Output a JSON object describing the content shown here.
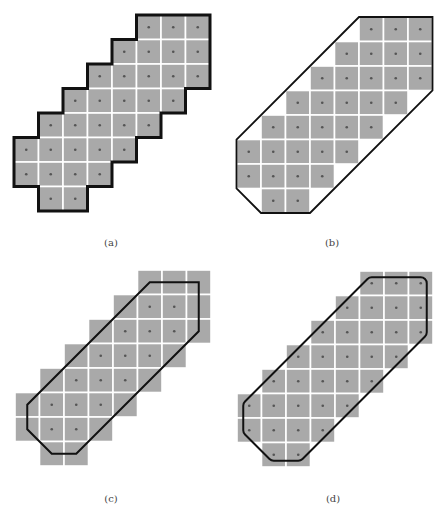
{
  "figure": {
    "cell_size": 24.5,
    "colors": {
      "pixel_fill": "#a9a9a9",
      "grid_line": "#ffffff",
      "dot": "#555555",
      "outline": "#111111"
    },
    "pixel_set": {
      "description": "Digital pixel set (rows top to bottom, column indices)",
      "rows": [
        [
          5,
          6,
          7
        ],
        [
          4,
          5,
          6,
          7
        ],
        [
          3,
          4,
          5,
          6,
          7
        ],
        [
          2,
          3,
          4,
          5,
          6
        ],
        [
          1,
          2,
          3,
          4,
          5
        ],
        [
          0,
          1,
          2,
          3,
          4
        ],
        [
          0,
          1,
          2,
          3
        ],
        [
          1,
          2
        ]
      ]
    },
    "panels": [
      {
        "id": "a",
        "caption": "(a)",
        "origin": [
          14,
          15
        ],
        "caption_pos": [
          111,
          242
        ],
        "outline_type": "pixel-boundary",
        "dots": "all"
      },
      {
        "id": "b",
        "caption": "(b)",
        "origin": [
          236.5,
          17
        ],
        "caption_pos": [
          332,
          242
        ],
        "outline_type": "hull-of-squares",
        "hull_vertices_grid": [
          [
            5,
            0
          ],
          [
            8,
            0
          ],
          [
            8,
            3
          ],
          [
            3,
            8
          ],
          [
            1,
            8
          ],
          [
            0,
            7
          ],
          [
            0,
            5
          ]
        ],
        "dots": "all"
      },
      {
        "id": "c",
        "caption": "(c)",
        "origin": [
          15,
          270
        ],
        "caption_pos": [
          111,
          498
        ],
        "outline_type": "hull-of-centers",
        "hull_vertices_grid": [
          [
            5,
            0
          ],
          [
            7,
            0
          ],
          [
            7,
            2
          ],
          [
            2,
            7
          ],
          [
            1,
            7
          ],
          [
            0,
            6
          ],
          [
            0,
            5
          ]
        ],
        "dots": "interior",
        "interior_dots": [
          [
            1,
            5
          ],
          [
            1,
            6
          ],
          [
            2,
            4
          ],
          [
            2,
            5
          ],
          [
            2,
            6
          ],
          [
            3,
            3
          ],
          [
            3,
            4
          ],
          [
            3,
            5
          ],
          [
            4,
            2
          ],
          [
            4,
            3
          ],
          [
            4,
            4
          ],
          [
            5,
            1
          ],
          [
            5,
            2
          ],
          [
            5,
            3
          ],
          [
            6,
            1
          ],
          [
            6,
            2
          ]
        ]
      },
      {
        "id": "d",
        "caption": "(d)",
        "origin": [
          237,
          271
        ],
        "caption_pos": [
          333,
          498
        ],
        "outline_type": "rounded-hull",
        "hull_vertices_grid": [
          [
            5,
            0
          ],
          [
            7,
            0
          ],
          [
            7,
            2
          ],
          [
            2,
            7
          ],
          [
            1,
            7
          ],
          [
            0,
            6
          ],
          [
            0,
            5
          ]
        ],
        "offset": 6,
        "dots": "all"
      }
    ]
  }
}
